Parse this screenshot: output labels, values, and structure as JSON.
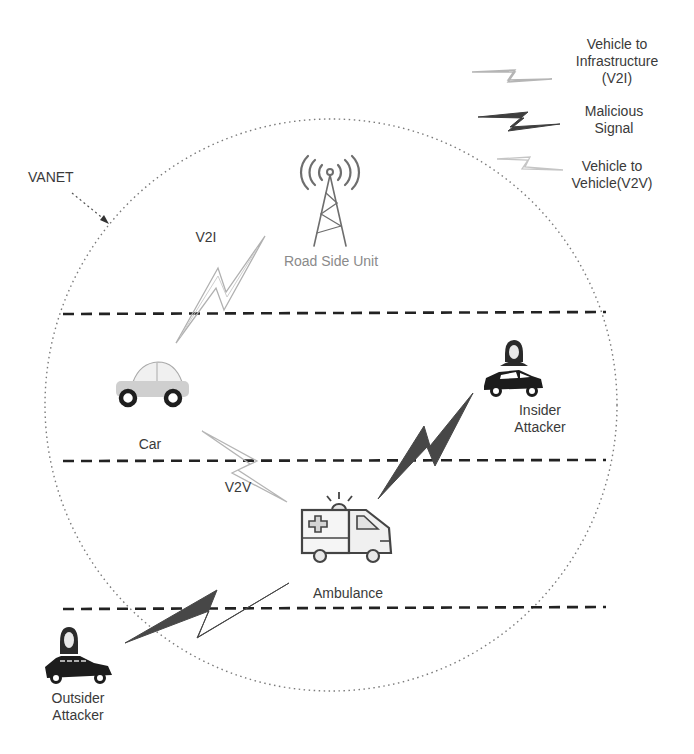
{
  "diagram": {
    "network_label": "VANET",
    "legend": [
      {
        "id": "v2i",
        "label_lines": [
          "Vehicle to",
          "Infrastructure",
          "(V2I)"
        ],
        "style": "outline-light-bolt",
        "color": "#b5b5b5"
      },
      {
        "id": "malicious",
        "label_lines": [
          "Malicious",
          "Signal"
        ],
        "style": "filled-dark-bolt",
        "color": "#4a4a4a"
      },
      {
        "id": "v2v",
        "label_lines": [
          "Vehicle to",
          "Vehicle(V2V)"
        ],
        "style": "outline-light-bolt",
        "color": "#c8c8c8"
      }
    ],
    "nodes": {
      "rsu": {
        "label": "Road Side Unit",
        "icon": "cell-tower-icon"
      },
      "car": {
        "label": "Car",
        "icon": "car-icon"
      },
      "ambulance": {
        "label": "Ambulance",
        "icon": "ambulance-icon"
      },
      "insider": {
        "label_lines": [
          "Insider",
          "Attacker"
        ],
        "icon": "hooded-attacker-car-icon"
      },
      "outsider": {
        "label_lines": [
          "Outsider",
          "Attacker"
        ],
        "icon": "hooded-attacker-car-icon"
      }
    },
    "links": [
      {
        "from": "car",
        "to": "rsu",
        "type": "V2I",
        "label": "V2I"
      },
      {
        "from": "car",
        "to": "ambulance",
        "type": "V2V",
        "label": "V2V"
      },
      {
        "from": "insider",
        "to": "ambulance",
        "type": "Malicious"
      },
      {
        "from": "outsider",
        "to": "ambulance",
        "type": "Malicious"
      }
    ],
    "lanes": 3,
    "colors": {
      "dark": "#3c3c3c",
      "light": "#b8b8b8",
      "text": "#3a3a3a",
      "rsu_text": "#8a8a8a"
    }
  }
}
